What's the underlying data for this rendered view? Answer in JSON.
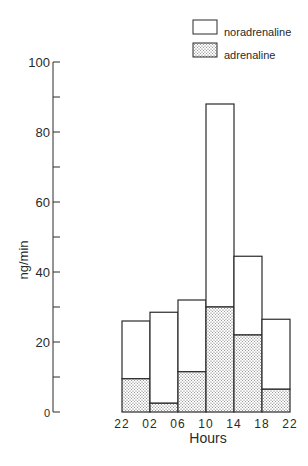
{
  "chart_data": {
    "type": "bar",
    "stacked": true,
    "title": "",
    "xlabel": "Hours",
    "ylabel": "ng/min",
    "ylim": [
      0,
      100
    ],
    "yticks_major": [
      0,
      20,
      40,
      60,
      80,
      100
    ],
    "yticks_minor": [
      10,
      30,
      50,
      70,
      90
    ],
    "grid": false,
    "legend_position": "top-right",
    "x_tick_labels": [
      "22",
      "02",
      "06",
      "10",
      "14",
      "18",
      "22"
    ],
    "categories": [
      "22-02",
      "02-06",
      "06-10",
      "10-14",
      "14-18",
      "18-22"
    ],
    "series": [
      {
        "name": "adrenaline",
        "pattern": "stippled",
        "values": [
          9.5,
          2.5,
          11.5,
          30,
          22,
          6.5
        ]
      },
      {
        "name": "noradrenaline",
        "pattern": "open",
        "values": [
          16.5,
          26,
          20.5,
          58,
          22.5,
          20
        ]
      }
    ],
    "totals": [
      26,
      28.5,
      32,
      88,
      44.5,
      26.5
    ]
  },
  "legend": {
    "items": [
      {
        "label": "noradrenaline",
        "pattern": "open"
      },
      {
        "label": "adrenaline",
        "pattern": "stippled"
      }
    ]
  },
  "axes": {
    "y_label": "ng/min",
    "x_label": "Hours",
    "y_tick_labels": [
      "0",
      "20",
      "40",
      "60",
      "80",
      "100"
    ]
  },
  "colors": {
    "ink": "#2a2a2a",
    "background": "#ffffff",
    "stipple": "#555555"
  }
}
